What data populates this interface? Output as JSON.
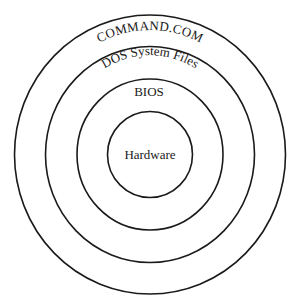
{
  "diagram": {
    "type": "concentric-layers",
    "center": {
      "x": 150,
      "y": 154.5
    },
    "layers": [
      {
        "label": "COMMAND.COM",
        "rx": 135.5,
        "ry": 139.5,
        "label_position": "arc-top",
        "font_size": 13
      },
      {
        "label": "DOS System Files",
        "rx": 104.5,
        "ry": 108,
        "label_position": "arc-top",
        "font_size": 13
      },
      {
        "label": "BIOS",
        "rx": 73,
        "ry": 75.5,
        "label_position": "arc-top",
        "font_size": 13
      },
      {
        "label": "Hardware",
        "rx": 42.5,
        "ry": 43,
        "label_position": "center",
        "font_size": 13
      }
    ],
    "stroke_color": "#1a1a1a",
    "background": "#ffffff"
  }
}
